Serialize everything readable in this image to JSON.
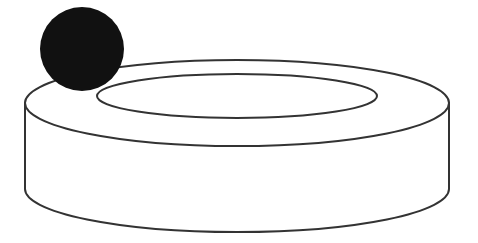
{
  "diagram": {
    "colors": {
      "background": "#ffffff",
      "stroke": "#333333",
      "ball": "#111111"
    },
    "ring": {
      "outer_top": {
        "cx": 237,
        "cy": 103,
        "rx": 212,
        "ry": 43
      },
      "inner_top": {
        "cx": 237,
        "cy": 96,
        "rx": 140,
        "ry": 22
      },
      "bottom": {
        "cx": 237,
        "cy": 189,
        "rx": 212,
        "ry": 43
      }
    },
    "ball": {
      "cx": 82,
      "cy": 49,
      "r": 42
    }
  }
}
